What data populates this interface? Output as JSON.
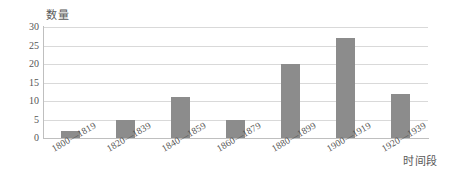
{
  "chart_data": {
    "type": "bar",
    "title": "",
    "subtitle": "",
    "xlabel": "时间段",
    "ylabel": "数量",
    "categories": [
      "1800—1819",
      "1820—1839",
      "1840—1859",
      "1860—1879",
      "1880—1899",
      "1900—1919",
      "1920—1939"
    ],
    "values": [
      2,
      5,
      11,
      5,
      20,
      27,
      12
    ],
    "ylim": [
      0,
      30
    ],
    "ytick_labels": [
      "0",
      "5",
      "10",
      "15",
      "20",
      "25",
      "30"
    ],
    "ytick_values": [
      0,
      5,
      10,
      15,
      20,
      25,
      30
    ],
    "grid": "horizontal",
    "legend": "none",
    "bar_color": "#8c8c8c",
    "gridline_color": "#d9d9d9",
    "axis_color": "#bfbfbf",
    "background_color": "#ffffff",
    "text_color": "#555555",
    "xtick_rotation_deg": -30
  }
}
